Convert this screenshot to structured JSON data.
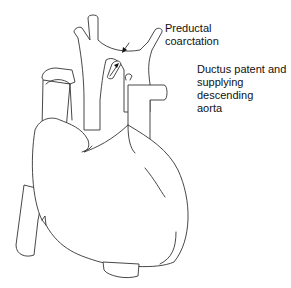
{
  "diagram": {
    "labels": [
      {
        "id": "preductal-coarctation",
        "lines": [
          "Preductal",
          "coarctation"
        ]
      },
      {
        "id": "ductus-patent",
        "lines": [
          "Ductus patent and",
          "supplying descending",
          "aorta"
        ]
      }
    ],
    "arrows": [
      {
        "target": "preductal-coarctation",
        "direction": "down-left"
      },
      {
        "target": "ductus-arteriosus",
        "direction": "up-right"
      }
    ],
    "colors": {
      "stroke": "#333333",
      "background": "#ffffff",
      "text": "#111111"
    }
  }
}
